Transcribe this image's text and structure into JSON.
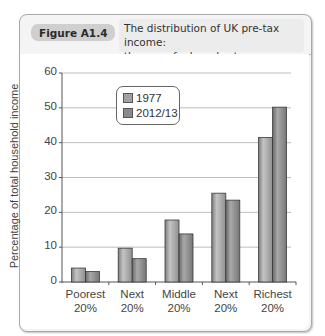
{
  "figure": {
    "label": "Figure A1.4",
    "title_line1": "The distribution of UK pre-tax income:",
    "title_line2": "the use of a bar chart"
  },
  "axes": {
    "ylabel": "Percentage of total household income",
    "yticks": [
      "0",
      "10",
      "20",
      "30",
      "40",
      "50",
      "60"
    ],
    "xticks": [
      {
        "line1": "Poorest",
        "line2": "20%"
      },
      {
        "line1": "Next",
        "line2": "20%"
      },
      {
        "line1": "Middle",
        "line2": "20%"
      },
      {
        "line1": "Next",
        "line2": "20%"
      },
      {
        "line1": "Richest",
        "line2": "20%"
      }
    ]
  },
  "legend": {
    "items": [
      {
        "label": "1977",
        "color": "#a2a2a2"
      },
      {
        "label": "2012/13",
        "color": "#8a8a8a"
      }
    ]
  },
  "colors": {
    "bar_1977": "#a2a2a2",
    "bar_2012": "#8a8a8a",
    "gridline": "#bdbdbd",
    "axis": "#555555"
  },
  "chart_data": {
    "type": "bar",
    "title": "The distribution of UK pre-tax income: the use of a bar chart",
    "xlabel": "",
    "ylabel": "Percentage of total household income",
    "categories": [
      "Poorest 20%",
      "Next 20%",
      "Middle 20%",
      "Next 20%",
      "Richest 20%"
    ],
    "series": [
      {
        "name": "1977",
        "values": [
          4,
          9.7,
          17.8,
          25.5,
          41.5
        ]
      },
      {
        "name": "2012/13",
        "values": [
          3,
          6.7,
          13.8,
          23.5,
          50.2
        ]
      }
    ],
    "ylim": [
      0,
      60
    ],
    "yticks": [
      0,
      10,
      20,
      30,
      40,
      50,
      60
    ],
    "grid": true,
    "legend_position": "upper-left inside plot"
  }
}
